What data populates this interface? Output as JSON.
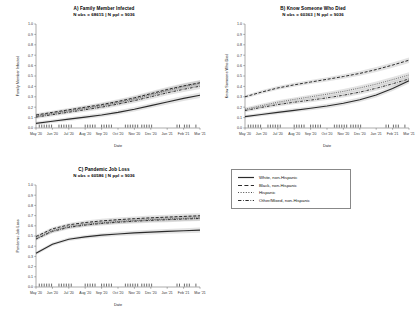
{
  "figure": {
    "xlabel": "Date",
    "x_tick_labels": [
      "May '20",
      "Jun '20",
      "Jul '20",
      "Aug '20",
      "Sep '20",
      "Oct '20",
      "Nov '20",
      "Dec '20",
      "Jan '21",
      "Feb '21",
      "Mar '21"
    ],
    "y_tick_labels": [
      "0.0",
      "0.1",
      "0.2",
      "0.3",
      "0.4",
      "0.5",
      "0.6",
      "0.7",
      "0.8",
      "0.9",
      "1.0"
    ],
    "legend": {
      "items": [
        {
          "label": "White, non-Hispanic",
          "style": "solid",
          "key": "white-non-hispanic"
        },
        {
          "label": "Black, non-Hispanic",
          "style": "dashed",
          "key": "black-non-hispanic"
        },
        {
          "label": "Hispanic",
          "style": "dotted",
          "key": "hispanic"
        },
        {
          "label": "Other/Mixed, non-Hispanic",
          "style": "dashdot",
          "key": "other-mixed-non-hispanic"
        }
      ]
    }
  },
  "chart_data": [
    {
      "type": "line",
      "panel": "A",
      "title": "A) Family Member Infected",
      "subtitle": "N obs = 68615 | N ppl = 9036",
      "xlabel": "Date",
      "ylabel": "Family Member Infected",
      "ylim": [
        0.0,
        1.0
      ],
      "xlim": [
        "May '20",
        "Mar '21"
      ],
      "grid": false,
      "x": [
        "May '20",
        "Jun '20",
        "Jul '20",
        "Aug '20",
        "Sep '20",
        "Oct '20",
        "Nov '20",
        "Dec '20",
        "Jan '21",
        "Feb '21",
        "Mar '21"
      ],
      "series": [
        {
          "name": "White, non-Hispanic",
          "style": "solid",
          "values": [
            0.045,
            0.065,
            0.085,
            0.105,
            0.125,
            0.15,
            0.18,
            0.215,
            0.25,
            0.285,
            0.315
          ]
        },
        {
          "name": "Black, non-Hispanic",
          "style": "dashed",
          "values": [
            0.125,
            0.15,
            0.175,
            0.2,
            0.225,
            0.255,
            0.29,
            0.33,
            0.37,
            0.405,
            0.435
          ]
        },
        {
          "name": "Hispanic",
          "style": "dotted",
          "values": [
            0.115,
            0.14,
            0.165,
            0.19,
            0.215,
            0.245,
            0.28,
            0.32,
            0.36,
            0.4,
            0.43
          ]
        },
        {
          "name": "Other/Mixed, non-Hispanic",
          "style": "dashdot",
          "values": [
            0.105,
            0.128,
            0.152,
            0.176,
            0.2,
            0.23,
            0.263,
            0.3,
            0.338,
            0.372,
            0.402
          ]
        }
      ]
    },
    {
      "type": "line",
      "panel": "B",
      "title": "B) Know Someone Who Died",
      "subtitle": "N obs = 60363 | N ppl = 9036",
      "xlabel": "Date",
      "ylabel": "Know Someone Who Died",
      "ylim": [
        0.0,
        1.0
      ],
      "xlim": [
        "May '20",
        "Mar '21"
      ],
      "grid": false,
      "x": [
        "May '20",
        "Jun '20",
        "Jul '20",
        "Aug '20",
        "Sep '20",
        "Oct '20",
        "Nov '20",
        "Dec '20",
        "Jan '21",
        "Feb '21",
        "Mar '21"
      ],
      "series": [
        {
          "name": "White, non-Hispanic",
          "style": "solid",
          "values": [
            0.11,
            0.13,
            0.15,
            0.17,
            0.19,
            0.212,
            0.238,
            0.272,
            0.318,
            0.38,
            0.455
          ]
        },
        {
          "name": "Black, non-Hispanic",
          "style": "dashed",
          "values": [
            0.3,
            0.345,
            0.385,
            0.415,
            0.442,
            0.468,
            0.495,
            0.525,
            0.562,
            0.605,
            0.652
          ]
        },
        {
          "name": "Hispanic",
          "style": "dotted",
          "values": [
            0.18,
            0.215,
            0.248,
            0.275,
            0.3,
            0.325,
            0.352,
            0.385,
            0.422,
            0.465,
            0.51
          ]
        },
        {
          "name": "Other/Mixed, non-Hispanic",
          "style": "dashdot",
          "values": [
            0.168,
            0.198,
            0.225,
            0.248,
            0.268,
            0.29,
            0.315,
            0.345,
            0.382,
            0.425,
            0.472
          ]
        }
      ]
    },
    {
      "type": "line",
      "panel": "C",
      "title": "C) Pandemic Job Loss",
      "subtitle": "N obs = 60586 | N ppl = 9036",
      "xlabel": "Date",
      "ylabel": "Pandemic Job Loss",
      "ylim": [
        0.0,
        1.0
      ],
      "xlim": [
        "May '20",
        "Mar '21"
      ],
      "grid": false,
      "x": [
        "May '20",
        "Jun '20",
        "Jul '20",
        "Aug '20",
        "Sep '20",
        "Oct '20",
        "Nov '20",
        "Dec '20",
        "Jan '21",
        "Feb '21",
        "Mar '21"
      ],
      "series": [
        {
          "name": "White, non-Hispanic",
          "style": "solid",
          "values": [
            0.33,
            0.42,
            0.468,
            0.492,
            0.508,
            0.52,
            0.53,
            0.538,
            0.545,
            0.552,
            0.558
          ]
        },
        {
          "name": "Black, non-Hispanic",
          "style": "dashed",
          "values": [
            0.495,
            0.57,
            0.61,
            0.632,
            0.648,
            0.66,
            0.67,
            0.678,
            0.685,
            0.692,
            0.698
          ]
        },
        {
          "name": "Hispanic",
          "style": "dotted",
          "values": [
            0.478,
            0.552,
            0.592,
            0.614,
            0.63,
            0.642,
            0.652,
            0.66,
            0.667,
            0.673,
            0.679
          ]
        },
        {
          "name": "Other/Mixed, non-Hispanic",
          "style": "dashdot",
          "values": [
            0.47,
            0.545,
            0.585,
            0.607,
            0.623,
            0.635,
            0.645,
            0.653,
            0.66,
            0.666,
            0.672
          ]
        }
      ]
    }
  ],
  "rug": {
    "positions": [
      0.02,
      0.035,
      0.05,
      0.065,
      0.08,
      0.095,
      0.14,
      0.155,
      0.17,
      0.185,
      0.2,
      0.215,
      0.3,
      0.315,
      0.33,
      0.345,
      0.36,
      0.4,
      0.415,
      0.43,
      0.445,
      0.46,
      0.545,
      0.56,
      0.575,
      0.59,
      0.605,
      0.62,
      0.645,
      0.66,
      0.675,
      0.69,
      0.705,
      0.86,
      0.875,
      0.905,
      0.92,
      0.935,
      0.975
    ]
  }
}
